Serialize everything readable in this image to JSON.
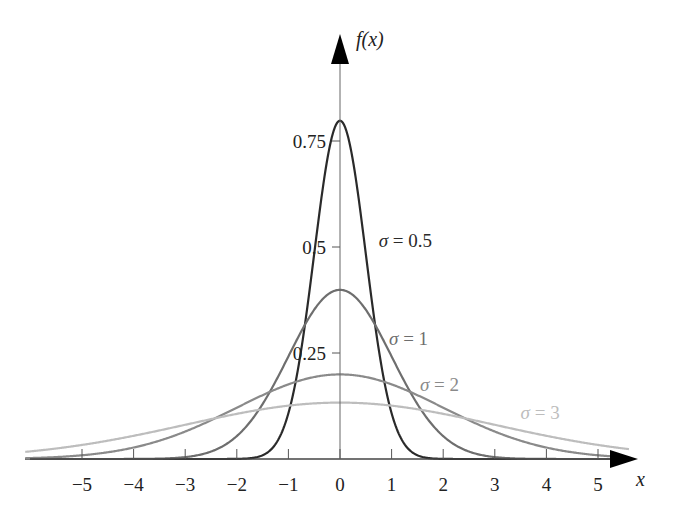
{
  "chart_data": {
    "type": "line",
    "title": "",
    "xlabel": "x",
    "ylabel": "f(x)",
    "xlim": [
      -6.3,
      5.8
    ],
    "ylim": [
      0,
      0.85
    ],
    "grid": false,
    "legend": "inline labels",
    "x_ticks": [
      -5,
      -4,
      -3,
      -2,
      -1,
      0,
      1,
      2,
      3,
      4,
      5
    ],
    "x_tick_labels": [
      "−5",
      "−4",
      "−3",
      "−2",
      "−1",
      "0",
      "1",
      "2",
      "3",
      "4",
      "5"
    ],
    "y_ticks": [
      0.25,
      0.5,
      0.75
    ],
    "y_tick_labels": [
      "0.25",
      "0.5",
      "0.75"
    ],
    "function": "normal density f(x) = 1/(sigma*sqrt(2*pi)) * exp(-x^2/(2*sigma^2))",
    "series": [
      {
        "name": "σ = 0.5",
        "sigma": 0.5,
        "peak": 0.798,
        "color": "#2a2a2a",
        "label_pos": [
          0.75,
          0.5
        ]
      },
      {
        "name": "σ = 1",
        "sigma": 1,
        "peak": 0.399,
        "color": "#6e6e6e",
        "label_pos": [
          0.95,
          0.27
        ]
      },
      {
        "name": "σ = 2",
        "sigma": 2,
        "peak": 0.199,
        "color": "#8a8a8a",
        "label_pos": [
          1.55,
          0.16
        ]
      },
      {
        "name": "σ = 3",
        "sigma": 3,
        "peak": 0.133,
        "color": "#bdbdbd",
        "label_pos": [
          3.5,
          0.095
        ]
      }
    ]
  }
}
